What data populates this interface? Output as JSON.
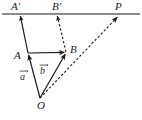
{
  "figure": {
    "type": "geometry-vector-diagram",
    "background_color": "#ffffff",
    "stroke_color": "#1a1a1a",
    "label_color": "#1a1a1a",
    "canvas": {
      "width": 142,
      "height": 120
    }
  },
  "labels": {
    "a_prime": "A′",
    "b_prime": "B′",
    "p": "P",
    "a_point": "A",
    "b_point": "B",
    "o_point": "O",
    "vector_a": "a",
    "vector_b": "b"
  },
  "points": {
    "A_prime": {
      "x": 20,
      "y": 14
    },
    "B_prime": {
      "x": 57,
      "y": 14
    },
    "P": {
      "x": 118,
      "y": 15
    },
    "A": {
      "x": 28,
      "y": 53
    },
    "B": {
      "x": 66,
      "y": 52
    },
    "O": {
      "x": 40,
      "y": 98
    }
  },
  "segments": [
    {
      "name": "top-horizontal-line",
      "from": "left-edge",
      "to": "right-edge",
      "style": "solid",
      "arrow": "none"
    },
    {
      "name": "A-to-A-prime",
      "from": "A",
      "to": "A_prime",
      "style": "solid",
      "arrow": "end"
    },
    {
      "name": "O-to-A",
      "from": "O",
      "to": "A",
      "style": "solid",
      "arrow": "end"
    },
    {
      "name": "O-to-B",
      "from": "O",
      "to": "B",
      "style": "solid",
      "arrow": "end"
    },
    {
      "name": "A-to-B",
      "from": "A",
      "to": "B",
      "style": "solid",
      "arrow": "end"
    },
    {
      "name": "B-to-B-prime",
      "from": "B",
      "to": "B_prime",
      "style": "dashed",
      "arrow": "end"
    },
    {
      "name": "O-to-P-ray",
      "from": "O",
      "to": "P",
      "style": "dashed",
      "arrow": "end"
    }
  ]
}
